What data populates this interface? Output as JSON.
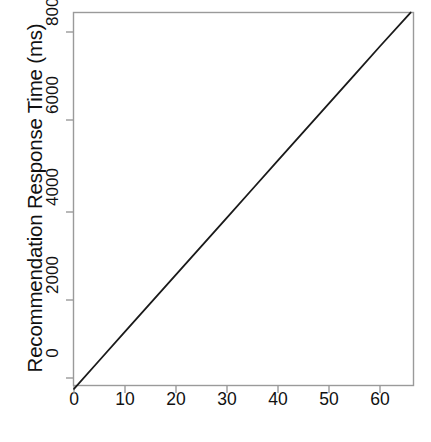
{
  "chart_data": {
    "type": "line",
    "title": "",
    "subtitle": "",
    "xlabel": "Number of Concurrent Clients",
    "ylabel": "Recommendation Response Time (ms)",
    "xlim": [
      -2.2,
      66.5
    ],
    "ylim": [
      -380,
      8560
    ],
    "xticks": [
      0,
      10,
      20,
      30,
      40,
      50,
      60
    ],
    "xtick_labels": [
      "0",
      "10",
      "20",
      "30",
      "40",
      "50",
      "60"
    ],
    "yticks": [
      0,
      2000,
      4000,
      6000,
      8000
    ],
    "ytick_labels": [
      "0",
      "2000",
      "4000",
      "6000",
      "8000"
    ],
    "grid": false,
    "legend": null,
    "legend_position": "none",
    "line_color": "#1a1a1a",
    "line_width": 1.8,
    "box_color": "#9a9a9a",
    "background": "#ffffff",
    "annotations": [],
    "series": [
      {
        "name": "Recommendation Response Time",
        "x": [
          0,
          5,
          10,
          15,
          20,
          25,
          30,
          35,
          40,
          45,
          50,
          55,
          60,
          66
        ],
        "values": [
          -250,
          410,
          1070,
          1730,
          2390,
          3050,
          3710,
          4370,
          5030,
          5690,
          6350,
          7010,
          7670,
          8450
        ]
      }
    ]
  },
  "axes": {
    "x_tick_label_texts": [
      "0",
      "10",
      "20",
      "30",
      "40",
      "50",
      "60"
    ],
    "y_tick_label_texts": [
      "0",
      "2000",
      "4000",
      "6000",
      "8000"
    ],
    "x_title": "Number of Concurrent Clients",
    "y_title": "Recommendation Response Time (ms)"
  }
}
